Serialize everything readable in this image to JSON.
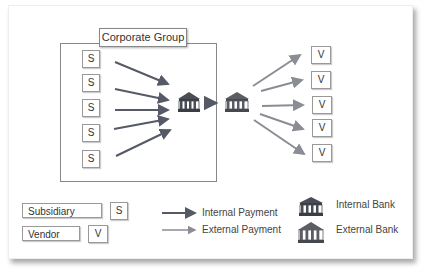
{
  "diagram": {
    "group_label": "Corporate Group",
    "subsidiaries": [
      {
        "label": "S"
      },
      {
        "label": "S"
      },
      {
        "label": "S"
      },
      {
        "label": "S"
      },
      {
        "label": "S"
      }
    ],
    "vendors": [
      {
        "label": "V"
      },
      {
        "label": "V"
      },
      {
        "label": "V"
      },
      {
        "label": "V"
      },
      {
        "label": "V"
      }
    ],
    "internal_bank_icon": "bank-icon",
    "external_bank_icon": "bank-icon"
  },
  "legend": {
    "subsidiary_label": "Subsidiary",
    "subsidiary_symbol": "S",
    "vendor_label": "Vendor",
    "vendor_symbol": "V",
    "internal_payment_label": "Internal Payment",
    "external_payment_label": "External Payment",
    "internal_bank_label": "Internal Bank",
    "external_bank_label": "External Bank"
  },
  "colors": {
    "internal_payment": "#555a66",
    "external_payment": "#8a8d93",
    "internal_bank": "#4a4d55",
    "external_bank": "#5a5d63"
  }
}
